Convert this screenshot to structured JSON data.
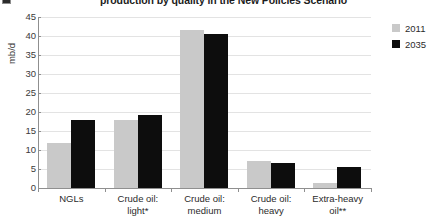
{
  "figure": {
    "marker_icon": "figure-number-marker",
    "title": "production by quality in the New Policies Scenario"
  },
  "chart_data": {
    "type": "bar",
    "title": "production by quality in the New Policies Scenario",
    "xlabel": "",
    "ylabel": "mb/d",
    "ylim": [
      0,
      45
    ],
    "yticks": [
      0,
      5,
      10,
      15,
      20,
      25,
      30,
      35,
      40,
      45
    ],
    "grid": true,
    "legend_position": "right",
    "categories": [
      "NGLs",
      "Crude oil:\nlight*",
      "Crude oil:\nmedium",
      "Crude oil:\nheavy",
      "Extra-heavy\noil**"
    ],
    "series": [
      {
        "name": "2011",
        "color": "#c9c9c9",
        "values": [
          11.8,
          18.0,
          41.5,
          7.2,
          1.4
        ]
      },
      {
        "name": "2035",
        "color": "#0d0d0d",
        "values": [
          17.9,
          19.3,
          40.5,
          6.7,
          5.4
        ]
      }
    ]
  },
  "legend": {
    "items": [
      {
        "label": "2011",
        "color": "#c9c9c9"
      },
      {
        "label": "2035",
        "color": "#0d0d0d"
      }
    ]
  },
  "axes": {
    "ylabel": "mb/d",
    "ytick_labels": [
      "45",
      "40",
      "35",
      "30",
      "25",
      "20",
      "15",
      "10",
      "5",
      "0"
    ],
    "xtick_labels": [
      [
        "NGLs"
      ],
      [
        "Crude oil:",
        "light*"
      ],
      [
        "Crude oil:",
        "medium"
      ],
      [
        "Crude oil:",
        "heavy"
      ],
      [
        "Extra-heavy",
        "oil**"
      ]
    ]
  }
}
